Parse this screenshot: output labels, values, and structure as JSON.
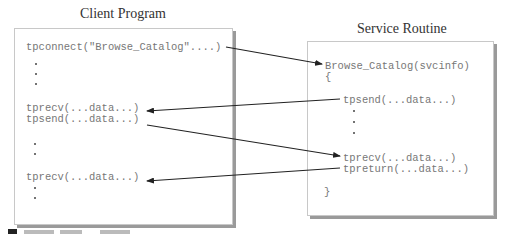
{
  "client": {
    "title": "Client Program",
    "lines": {
      "connect": "tpconnect(\"Browse_Catalog\"....)",
      "recv1": "tprecv(...data...)",
      "send1": "tpsend(...data...)",
      "recv2": "tprecv(...data...)"
    }
  },
  "service": {
    "title": "Service Routine",
    "lines": {
      "header": "Browse_Catalog(svcinfo)",
      "open_brace": "{",
      "send1": "tpsend(...data...)",
      "recv1": "tprecv(...data...)",
      "return1": "tpreturn(...data...)",
      "close_brace": "}"
    }
  },
  "arrows": [
    {
      "from": "client.connect",
      "to": "service.header",
      "direction": "client-to-service"
    },
    {
      "from": "service.send1",
      "to": "client.recv1",
      "direction": "service-to-client"
    },
    {
      "from": "client.send1",
      "to": "service.recv1",
      "direction": "client-to-service"
    },
    {
      "from": "service.return1",
      "to": "client.recv2",
      "direction": "service-to-client"
    }
  ],
  "colors": {
    "code_text": "#777777",
    "arrow": "#222222",
    "box_shadow": "#9a9a9a"
  }
}
